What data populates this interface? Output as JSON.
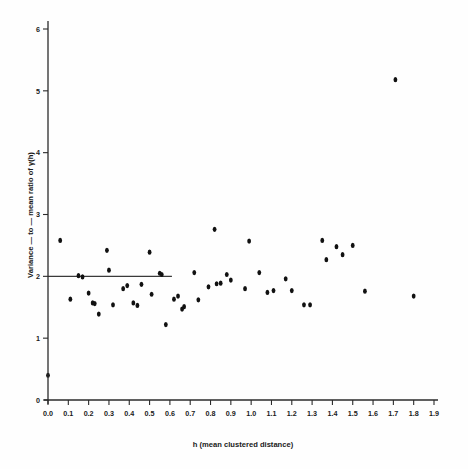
{
  "figure": {
    "background_color": "#fefefe",
    "ink_color": "#111111"
  },
  "chart_data": {
    "type": "scatter",
    "title": "",
    "subtitle": "",
    "xlabel": "h (mean clustered distance)",
    "ylabel": "Variance — to — mean ratio of  γ(h)",
    "xlim": [
      0.0,
      1.9
    ],
    "ylim": [
      0,
      6
    ],
    "grid": false,
    "legend": null,
    "xticks": [
      "0.0",
      "0.1",
      "0.2",
      "0.3",
      "0.4",
      "0.5",
      "0.6",
      "0.7",
      "0.8",
      "0.9",
      "1.0",
      "1.1",
      "1.2",
      "1.3",
      "1.4",
      "1.5",
      "1.6",
      "1.7",
      "1.8",
      "1.9"
    ],
    "xtick_values": [
      0.0,
      0.1,
      0.2,
      0.3,
      0.4,
      0.5,
      0.6,
      0.7,
      0.8,
      0.9,
      1.0,
      1.1,
      1.2,
      1.3,
      1.4,
      1.5,
      1.6,
      1.7,
      1.8,
      1.9
    ],
    "yticks": [
      "0",
      "1",
      "2",
      "3",
      "4",
      "5",
      "6"
    ],
    "ytick_values": [
      0,
      1,
      2,
      3,
      4,
      5,
      6
    ],
    "series": [
      {
        "name": "variance-to-mean ratio",
        "marker": "filled-circle",
        "color": "#111111",
        "points": [
          [
            0.0,
            0.4
          ],
          [
            0.06,
            2.58
          ],
          [
            0.11,
            1.63
          ],
          [
            0.15,
            2.01
          ],
          [
            0.17,
            1.99
          ],
          [
            0.2,
            1.73
          ],
          [
            0.22,
            1.57
          ],
          [
            0.23,
            1.56
          ],
          [
            0.25,
            1.39
          ],
          [
            0.29,
            2.42
          ],
          [
            0.3,
            2.1
          ],
          [
            0.32,
            1.54
          ],
          [
            0.37,
            1.8
          ],
          [
            0.39,
            1.85
          ],
          [
            0.42,
            1.57
          ],
          [
            0.44,
            1.53
          ],
          [
            0.46,
            1.87
          ],
          [
            0.5,
            2.39
          ],
          [
            0.51,
            1.71
          ],
          [
            0.55,
            2.05
          ],
          [
            0.56,
            2.03
          ],
          [
            0.58,
            1.22
          ],
          [
            0.62,
            1.63
          ],
          [
            0.64,
            1.68
          ],
          [
            0.66,
            1.47
          ],
          [
            0.67,
            1.51
          ],
          [
            0.72,
            2.06
          ],
          [
            0.74,
            1.62
          ],
          [
            0.79,
            1.83
          ],
          [
            0.82,
            2.76
          ],
          [
            0.83,
            1.88
          ],
          [
            0.85,
            1.89
          ],
          [
            0.88,
            2.03
          ],
          [
            0.9,
            1.94
          ],
          [
            0.97,
            1.8
          ],
          [
            0.99,
            2.57
          ],
          [
            1.04,
            2.06
          ],
          [
            1.08,
            1.74
          ],
          [
            1.11,
            1.77
          ],
          [
            1.17,
            1.96
          ],
          [
            1.2,
            1.77
          ],
          [
            1.26,
            1.54
          ],
          [
            1.29,
            1.54
          ],
          [
            1.35,
            2.58
          ],
          [
            1.37,
            2.27
          ],
          [
            1.42,
            2.48
          ],
          [
            1.45,
            2.35
          ],
          [
            1.5,
            2.5
          ],
          [
            1.56,
            1.76
          ],
          [
            1.71,
            5.18
          ],
          [
            1.8,
            1.68
          ]
        ]
      }
    ],
    "reference_lines": [
      {
        "name": "horizontal-reference-line",
        "orientation": "horizontal",
        "y": 2.0,
        "x_start": 0.0,
        "x_end": 0.61,
        "color": "#3a3a3a"
      }
    ]
  }
}
